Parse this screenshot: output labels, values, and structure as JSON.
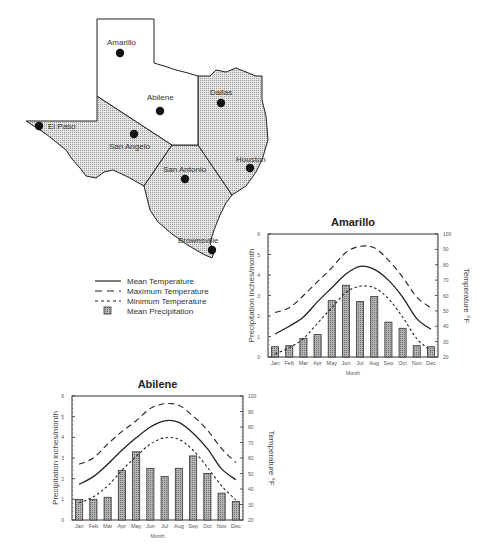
{
  "map": {
    "title": "Texas climate regions",
    "cities": [
      {
        "name": "Amarillo",
        "x": 120,
        "y": 53,
        "lx": 107,
        "ly": 45
      },
      {
        "name": "Abilene",
        "x": 160,
        "y": 111,
        "lx": 147,
        "ly": 100
      },
      {
        "name": "Dallas",
        "x": 221,
        "y": 103,
        "lx": 210,
        "ly": 95
      },
      {
        "name": "El Paso",
        "x": 39,
        "y": 126,
        "lx": 48,
        "ly": 129
      },
      {
        "name": "San Angelo",
        "x": 134,
        "y": 134,
        "lx": 109,
        "ly": 149
      },
      {
        "name": "San Antonio",
        "x": 185,
        "y": 179,
        "lx": 163,
        "ly": 172
      },
      {
        "name": "Houston",
        "x": 250,
        "y": 168,
        "lx": 236,
        "ly": 162
      },
      {
        "name": "Brownsville",
        "x": 212,
        "y": 250,
        "lx": 178,
        "ly": 243
      }
    ]
  },
  "legend": {
    "items": [
      {
        "label": "Mean Temperature",
        "style": "solid"
      },
      {
        "label": "Maximum Temperature",
        "style": "long-dash"
      },
      {
        "label": "Minimum Temperature",
        "style": "short-dash"
      },
      {
        "label": "Mean Precipitation",
        "style": "bar"
      }
    ]
  },
  "chart_data": [
    {
      "type": "bar",
      "title": "Amarillo",
      "xlabel": "Month",
      "ylabel": "Precipitation  inches/month",
      "y2label": "Temperature °F",
      "categories": [
        "Jan",
        "Feb",
        "Mar",
        "Apr",
        "May",
        "Jun",
        "Jul",
        "Aug",
        "Sep",
        "Oct",
        "Nov",
        "Dec"
      ],
      "ylim": [
        0,
        6
      ],
      "y2lim": [
        20,
        100
      ],
      "yticks": [
        0,
        1,
        2,
        3,
        4,
        5,
        6
      ],
      "y2ticks": [
        20,
        30,
        40,
        50,
        60,
        70,
        80,
        90,
        100
      ],
      "series": [
        {
          "name": "Mean Precipitation",
          "type": "bar",
          "axis": "left",
          "values": [
            0.5,
            0.55,
            0.9,
            1.1,
            2.75,
            3.5,
            2.7,
            2.95,
            1.7,
            1.4,
            0.55,
            0.5
          ]
        },
        {
          "name": "Mean Temperature",
          "type": "line",
          "style": "solid",
          "axis": "right",
          "values": [
            35,
            40,
            46,
            56,
            65,
            74,
            79,
            77,
            70,
            59,
            45,
            38
          ]
        },
        {
          "name": "Maximum Temperature",
          "type": "line",
          "style": "long-dash",
          "axis": "right",
          "values": [
            49,
            52,
            60,
            69,
            78,
            88,
            92,
            91,
            83,
            72,
            59,
            52
          ]
        },
        {
          "name": "Minimum Temperature",
          "type": "line",
          "style": "short-dash",
          "axis": "right",
          "values": [
            22,
            26,
            32,
            42,
            52,
            62,
            66,
            65,
            58,
            46,
            32,
            24
          ]
        }
      ],
      "grid": false,
      "legend_position": "left of chart (shared)"
    },
    {
      "type": "bar",
      "title": "Abilene",
      "xlabel": "Month",
      "ylabel": "Precipitation  inches/month",
      "y2label": "Temperature °F",
      "categories": [
        "Jan",
        "Feb",
        "Mar",
        "Apr",
        "May",
        "Jun",
        "Jul",
        "Aug",
        "Sep",
        "Oct",
        "Nov",
        "Dec"
      ],
      "ylim": [
        0,
        6
      ],
      "y2lim": [
        20,
        100
      ],
      "yticks": [
        0,
        1,
        2,
        3,
        4,
        5,
        6
      ],
      "y2ticks": [
        20,
        30,
        40,
        50,
        60,
        70,
        80,
        90,
        100
      ],
      "series": [
        {
          "name": "Mean Precipitation",
          "type": "bar",
          "axis": "left",
          "values": [
            1.0,
            1.0,
            1.1,
            2.4,
            3.3,
            2.5,
            2.1,
            2.5,
            3.1,
            2.25,
            1.3,
            0.9
          ]
        },
        {
          "name": "Mean Temperature",
          "type": "line",
          "style": "solid",
          "axis": "right",
          "values": [
            43,
            48,
            56,
            65,
            73,
            80,
            84,
            83,
            76,
            66,
            53,
            46
          ]
        },
        {
          "name": "Maximum Temperature",
          "type": "line",
          "style": "long-dash",
          "axis": "right",
          "values": [
            56,
            60,
            69,
            77,
            84,
            92,
            95,
            94,
            87,
            78,
            66,
            57
          ]
        },
        {
          "name": "Minimum Temperature",
          "type": "line",
          "style": "short-dash",
          "axis": "right",
          "values": [
            31,
            35,
            42,
            52,
            61,
            69,
            73,
            72,
            65,
            54,
            42,
            33
          ]
        }
      ],
      "grid": false,
      "legend_position": "shared legend above"
    }
  ]
}
